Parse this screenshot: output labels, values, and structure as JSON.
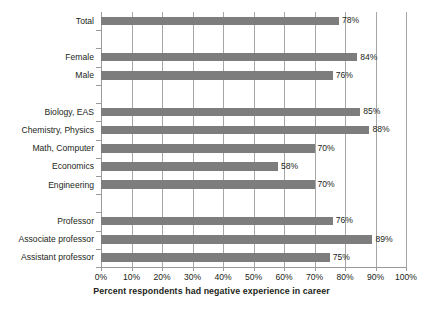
{
  "chart_data": {
    "type": "bar",
    "orientation": "horizontal",
    "title": "",
    "xlabel": "Percent respondents had negative experience in career",
    "ylabel": "",
    "xlim": [
      0,
      100
    ],
    "xtick_labels": [
      "0%",
      "10%",
      "20%",
      "30%",
      "40%",
      "50%",
      "60%",
      "70%",
      "80%",
      "90%",
      "100%"
    ],
    "xtick_values": [
      0,
      10,
      20,
      30,
      40,
      50,
      60,
      70,
      80,
      90,
      100
    ],
    "grid": "vertical",
    "legend": "none",
    "bar_color": "#7d7d7d",
    "categories": [
      "Total",
      "",
      "Female",
      "Male",
      "",
      "Biology, EAS",
      "Chemistry, Physics",
      "Math, Computer",
      "Economics",
      "Engineering",
      "",
      "Professor",
      "Associate professor",
      "Assistant professor"
    ],
    "values": [
      78,
      null,
      84,
      76,
      null,
      85,
      88,
      70,
      58,
      70,
      null,
      76,
      89,
      75
    ],
    "data_labels": [
      "78%",
      "",
      "84%",
      "76%",
      "",
      "85%",
      "88%",
      "70%",
      "58%",
      "70%",
      "",
      "76%",
      "89%",
      "75%"
    ],
    "groups": [
      {
        "name": "Overall",
        "categories": [
          "Total"
        ]
      },
      {
        "name": "Gender",
        "categories": [
          "Female",
          "Male"
        ]
      },
      {
        "name": "Field",
        "categories": [
          "Biology, EAS",
          "Chemistry, Physics",
          "Math, Computer",
          "Economics",
          "Engineering"
        ]
      },
      {
        "name": "Rank",
        "categories": [
          "Professor",
          "Associate professor",
          "Assistant professor"
        ]
      }
    ]
  }
}
